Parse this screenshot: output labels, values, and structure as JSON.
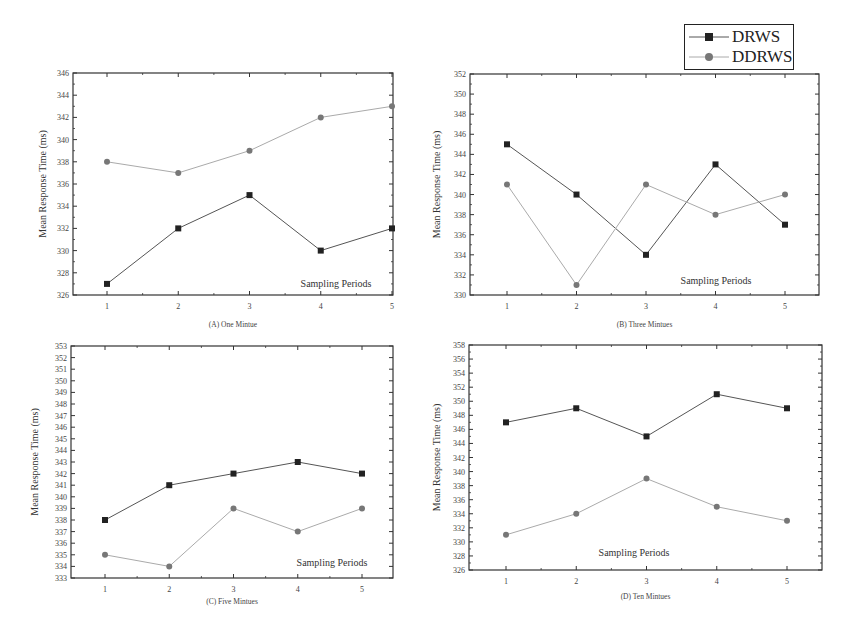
{
  "legend": {
    "items": [
      {
        "label": "DRWS",
        "marker": "square",
        "color": "#222222",
        "line_color": "#555555"
      },
      {
        "label": "DDRWS",
        "marker": "circle",
        "color": "#777777",
        "line_color": "#aaaaaa"
      }
    ]
  },
  "chart_data": [
    {
      "type": "line",
      "caption": "(A) One Mintue",
      "xlabel": "Sampling Periods",
      "ylabel": "Mean Response Time (ms)",
      "x": [
        1,
        2,
        3,
        4,
        5
      ],
      "ylim": [
        326,
        346
      ],
      "yticks": [
        326,
        328,
        330,
        332,
        334,
        336,
        338,
        340,
        342,
        344,
        346
      ],
      "series": [
        {
          "name": "DRWS",
          "values": [
            327,
            332,
            335,
            330,
            332
          ]
        },
        {
          "name": "DDRWS",
          "values": [
            338,
            337,
            339,
            342,
            343
          ]
        }
      ],
      "grid": false,
      "legend_position": "shared top-right"
    },
    {
      "type": "line",
      "caption": "(B) Three Mintues",
      "xlabel": "Sampling Periods",
      "ylabel": "Mean Response Time (ms)",
      "x": [
        1,
        2,
        3,
        4,
        5
      ],
      "ylim": [
        330,
        352
      ],
      "yticks": [
        330,
        332,
        334,
        336,
        338,
        340,
        342,
        344,
        346,
        348,
        350,
        352
      ],
      "series": [
        {
          "name": "DRWS",
          "values": [
            345,
            340,
            334,
            343,
            337
          ]
        },
        {
          "name": "DDRWS",
          "values": [
            341,
            331,
            341,
            338,
            340
          ]
        }
      ],
      "grid": false,
      "legend_position": "shared top-right"
    },
    {
      "type": "line",
      "caption": "(C) Five Mintues",
      "xlabel": "Sampling Periods",
      "ylabel": "Mean Response Time (ms)",
      "x": [
        1,
        2,
        3,
        4,
        5
      ],
      "ylim": [
        333,
        353
      ],
      "yticks": [
        333,
        334,
        335,
        336,
        337,
        338,
        339,
        340,
        341,
        342,
        343,
        344,
        345,
        346,
        347,
        348,
        349,
        350,
        351,
        352,
        353
      ],
      "series": [
        {
          "name": "DRWS",
          "values": [
            338,
            341,
            342,
            343,
            342
          ]
        },
        {
          "name": "DDRWS",
          "values": [
            335,
            334,
            339,
            337,
            339
          ]
        }
      ],
      "grid": false,
      "legend_position": "shared top-right"
    },
    {
      "type": "line",
      "caption": "(D) Ten Mintues",
      "xlabel": "Sampling Periods",
      "ylabel": "Mean Response Time (ms)",
      "x": [
        1,
        2,
        3,
        4,
        5
      ],
      "ylim": [
        326,
        358
      ],
      "yticks": [
        326,
        328,
        330,
        332,
        334,
        336,
        338,
        340,
        342,
        344,
        346,
        348,
        350,
        352,
        354,
        356,
        358
      ],
      "series": [
        {
          "name": "DRWS",
          "values": [
            347,
            349,
            345,
            351,
            349
          ]
        },
        {
          "name": "DDRWS",
          "values": [
            331,
            334,
            339,
            335,
            333
          ]
        }
      ],
      "grid": false,
      "legend_position": "shared top-right"
    }
  ]
}
